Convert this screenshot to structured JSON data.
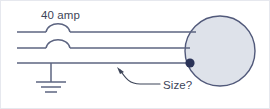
{
  "figure": {
    "kind": "electrical-one-line-diagram",
    "background_color": "#ffffff",
    "line_color": "#5c6480",
    "ink_color": "#3d4558",
    "border_color": "#dfe1e8"
  },
  "labels": {
    "rating_label": "40 amp",
    "callout_label": "Size?"
  },
  "conductors": [
    {
      "name": "conductor-1-with-fuse",
      "y": 32,
      "has_fuse": true
    },
    {
      "name": "conductor-2-with-fuse",
      "y": 48,
      "has_fuse": true
    },
    {
      "name": "conductor-3-grounded",
      "y": 63,
      "has_fuse": false
    }
  ],
  "load": {
    "name": "load-circle",
    "shape": "circle",
    "center_x": 220,
    "center_y": 51,
    "radius": 35,
    "fill_color": "#dee2ea",
    "stroke_color": "#51597a"
  },
  "terminal": {
    "name": "connection-dot",
    "x": 190,
    "y": 63,
    "radius": 4.5,
    "color": "#2b3358"
  },
  "ground": {
    "name": "earth-ground-symbol",
    "x": 51,
    "top_y": 63,
    "stem_bottom_y": 88,
    "bars": [
      15,
      10,
      6
    ]
  },
  "callout": {
    "name": "size-callout",
    "arrow_tip_x": 118,
    "arrow_tip_y": 68,
    "leader_end_x": 160,
    "leader_end_y": 84,
    "text_x": 163,
    "text_y": 88
  }
}
